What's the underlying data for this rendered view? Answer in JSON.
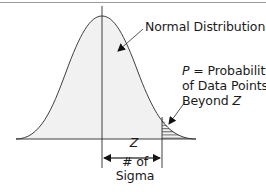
{
  "diagram": {
    "title": "Normal Distribution",
    "curve_label": "Normal Distribution",
    "tail_label": {
      "variable": "P",
      "line1_rest": " = Probability",
      "line2": "of Data Points",
      "line3_prefix": "Beyond ",
      "line3_var": "Z"
    },
    "measure_label": {
      "variable": "Z",
      "line2": "# of",
      "line3": "Sigma"
    },
    "colors": {
      "curve_fill": "#f1f1f1",
      "line": "#2a2a2a",
      "frame": "#9a9a9a",
      "hatch": "#333333"
    }
  }
}
